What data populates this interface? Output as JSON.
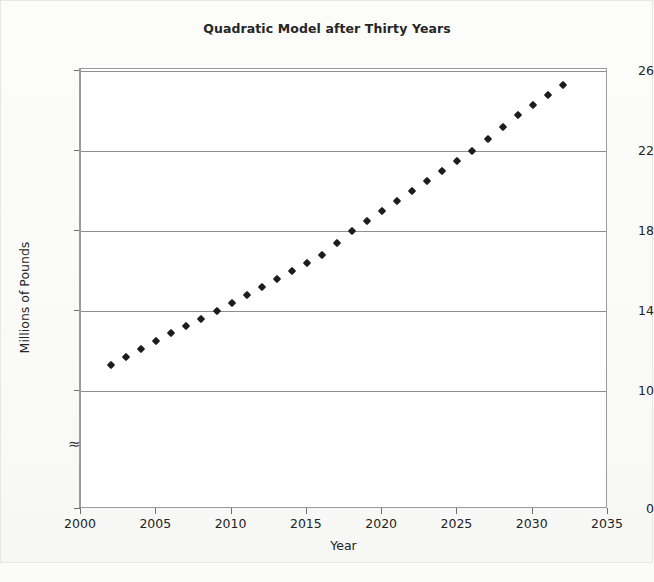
{
  "figure": {
    "background_color": "#fbfbfa",
    "plot_background_color": "#ffffff",
    "frame_border_color": "#9a9a9a",
    "marker_color": "#1c1c1c",
    "gridline_color": "#8e8e8e",
    "axis_break_symbol": "≈"
  },
  "chart_data": {
    "type": "scatter",
    "title": "Quadratic Model after Thirty Years",
    "xlabel": "Year",
    "ylabel": "Millions of Pounds",
    "xlim": [
      2000,
      2035
    ],
    "ylim": [
      10,
      26
    ],
    "y_axis_has_break": true,
    "y_axis_break_between": [
      0,
      10
    ],
    "y_baseline_label": "0",
    "xticks": [
      2000,
      2005,
      2010,
      2015,
      2020,
      2025,
      2030,
      2035
    ],
    "xtick_labels": [
      "2000",
      "2005",
      "2010",
      "2015",
      "2020",
      "2025",
      "2030",
      "2035"
    ],
    "yticks": [
      0,
      10,
      14,
      18,
      22,
      26
    ],
    "ytick_labels": [
      "0",
      "10",
      "14",
      "18",
      "22",
      "26"
    ],
    "grid": true,
    "grid_axis": "y",
    "gridlines_at": [
      10,
      14,
      18,
      22,
      26
    ],
    "legend": null,
    "marker_shape": "diamond",
    "x": [
      2002,
      2003,
      2004,
      2005,
      2006,
      2007,
      2008,
      2009,
      2010,
      2011,
      2012,
      2013,
      2014,
      2015,
      2016,
      2017,
      2018,
      2019,
      2020,
      2021,
      2022,
      2023,
      2024,
      2025,
      2026,
      2027,
      2028,
      2029,
      2030,
      2031,
      2032
    ],
    "values": [
      11.3,
      11.7,
      12.1,
      12.5,
      12.9,
      13.25,
      13.6,
      14.0,
      14.4,
      14.8,
      15.2,
      15.6,
      16.0,
      16.4,
      16.8,
      17.4,
      18.0,
      18.5,
      19.0,
      19.5,
      20.0,
      20.5,
      21.0,
      21.5,
      22.0,
      22.6,
      23.2,
      23.8,
      24.3,
      24.8,
      25.3
    ]
  }
}
